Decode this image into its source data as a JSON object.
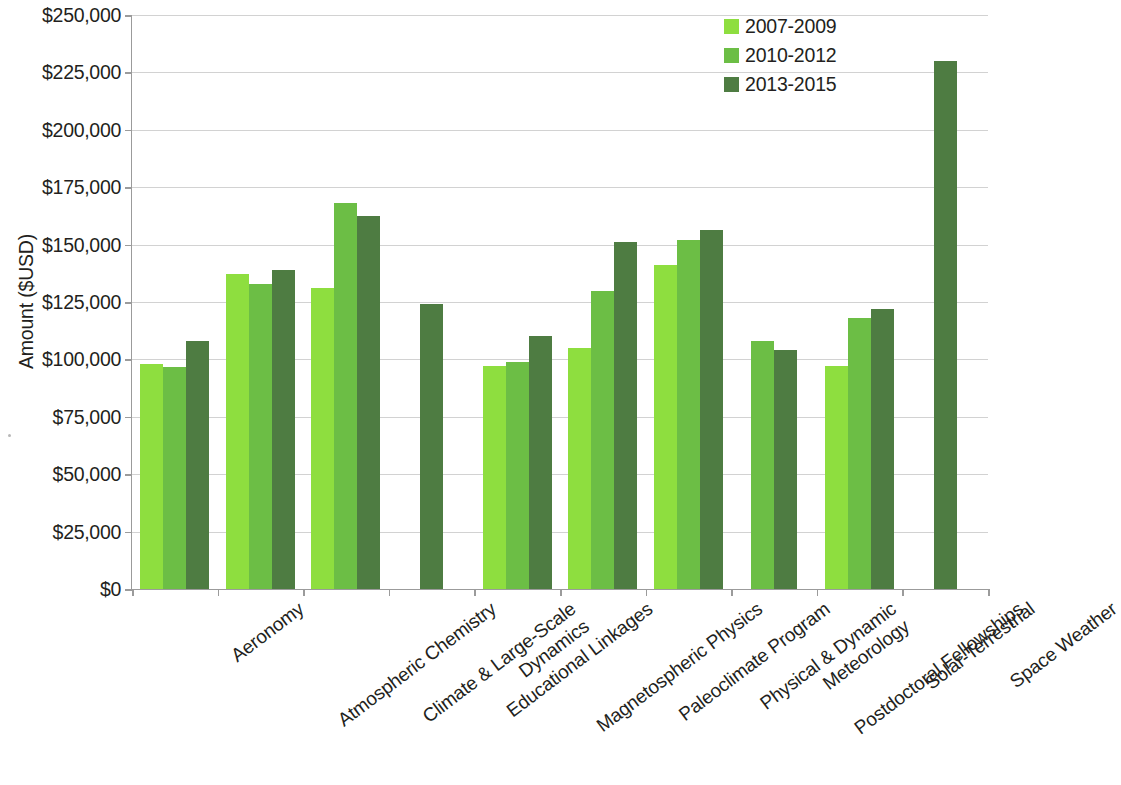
{
  "chart_data": {
    "type": "bar",
    "title": "",
    "subtitle": "",
    "xlabel": "",
    "ylabel": "Amount ($USD)",
    "ylim": [
      0,
      250000
    ],
    "ytick_step": 25000,
    "ytick_labels": [
      "$250,000",
      "$225,000",
      "$200,000",
      "$175,000",
      "$150,000",
      "$125,000",
      "$100,000",
      "$75,000",
      "$50,000",
      "$25,000",
      "$0"
    ],
    "ytick_values": [
      250000,
      225000,
      200000,
      175000,
      150000,
      125000,
      100000,
      75000,
      50000,
      25000,
      0
    ],
    "grid": true,
    "legend_position": "top-right",
    "categories": [
      "Aeronomy",
      "Atmospheric Chemistry",
      "Climate & Large-Scale\nDynamics",
      "Educational Linkages",
      "Magnetospheric Physics",
      "Paleoclimate Program",
      "Physical & Dynamic\nMeteorology",
      "Postdoctoral Fellowships",
      "Solar-Terrestrial",
      "Space Weather"
    ],
    "series": [
      {
        "name": "2007-2009",
        "color": "#8ede3f",
        "values": [
          98000,
          137000,
          131000,
          null,
          97000,
          105000,
          141000,
          null,
          97000,
          null
        ]
      },
      {
        "name": "2010-2012",
        "color": "#6cbe45",
        "values": [
          96500,
          133000,
          168000,
          null,
          99000,
          130000,
          152000,
          108000,
          118000,
          null
        ]
      },
      {
        "name": "2013-2015",
        "color": "#4e7c42",
        "values": [
          108000,
          139000,
          162500,
          124000,
          110000,
          151000,
          156500,
          104000,
          122000,
          230000
        ]
      }
    ]
  },
  "axis": {
    "y_title": "Amount ($USD)"
  },
  "legend": {
    "entries": [
      {
        "label": "2007-2009",
        "color": "#8ede3f"
      },
      {
        "label": "2010-2012",
        "color": "#6cbe45"
      },
      {
        "label": "2013-2015",
        "color": "#4e7c42"
      }
    ]
  }
}
